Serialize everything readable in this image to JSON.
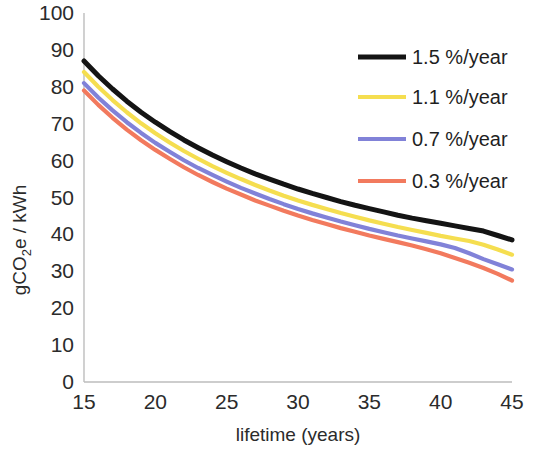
{
  "chart_data": {
    "type": "line",
    "title": "",
    "xlabel": "lifetime (years)",
    "ylabel": "gCO2e / kWh",
    "ylabel_parts": {
      "pre": "gCO",
      "sub": "2",
      "post": "e / kWh"
    },
    "xlim": [
      15,
      45
    ],
    "ylim": [
      0,
      100
    ],
    "xticks": [
      15,
      20,
      25,
      30,
      35,
      40,
      45
    ],
    "yticks": [
      0,
      10,
      20,
      30,
      40,
      50,
      60,
      70,
      80,
      90,
      100
    ],
    "grid": false,
    "legend_position": "top-right",
    "x": [
      15,
      16,
      17,
      18,
      19,
      20,
      21,
      22,
      23,
      24,
      25,
      26,
      27,
      28,
      29,
      30,
      31,
      32,
      33,
      34,
      35,
      36,
      37,
      38,
      39,
      40,
      41,
      42,
      43,
      44,
      45
    ],
    "series": [
      {
        "name": "1.5 %/year",
        "color": "#141414",
        "values": [
          87.0,
          83.0,
          79.4,
          76.1,
          73.1,
          70.4,
          67.9,
          65.6,
          63.5,
          61.5,
          59.7,
          58.0,
          56.4,
          55.0,
          53.6,
          52.3,
          51.1,
          50.0,
          48.9,
          47.9,
          47.0,
          46.1,
          45.2,
          44.4,
          43.7,
          43.0,
          42.3,
          41.6,
          40.9,
          39.7,
          38.5
        ]
      },
      {
        "name": "1.1 %/year",
        "color": "#F5DE50",
        "values": [
          84.0,
          80.0,
          76.4,
          73.1,
          70.1,
          67.4,
          64.9,
          62.6,
          60.5,
          58.5,
          56.7,
          55.0,
          53.4,
          51.9,
          50.5,
          49.2,
          48.0,
          46.9,
          45.8,
          44.8,
          43.8,
          42.9,
          42.0,
          41.2,
          40.4,
          39.6,
          38.9,
          38.2,
          37.2,
          35.9,
          34.5
        ]
      },
      {
        "name": "0.7 %/year",
        "color": "#8182D8",
        "values": [
          81.0,
          77.1,
          73.6,
          70.4,
          67.5,
          64.8,
          62.4,
          60.1,
          58.0,
          56.1,
          54.3,
          52.6,
          51.1,
          49.6,
          48.2,
          46.9,
          45.7,
          44.6,
          43.5,
          42.5,
          41.5,
          40.6,
          39.7,
          38.9,
          38.1,
          37.3,
          36.3,
          34.9,
          33.3,
          31.9,
          30.5
        ]
      },
      {
        "name": "0.3 %/year",
        "color": "#F27A5E",
        "values": [
          79.0,
          75.1,
          71.6,
          68.4,
          65.5,
          62.9,
          60.5,
          58.2,
          56.1,
          54.2,
          52.4,
          50.8,
          49.2,
          47.8,
          46.4,
          45.1,
          43.9,
          42.8,
          41.7,
          40.7,
          39.7,
          38.8,
          37.9,
          37.0,
          36.0,
          34.9,
          33.6,
          32.3,
          30.9,
          29.3,
          27.5
        ]
      }
    ],
    "legend": [
      {
        "label": "1.5 %/year",
        "color": "#141414",
        "width": 5.0
      },
      {
        "label": "1.1 %/year",
        "color": "#F5DE50",
        "width": 4.0
      },
      {
        "label": "0.7 %/year",
        "color": "#8182D8",
        "width": 4.0
      },
      {
        "label": "0.3 %/year",
        "color": "#F27A5E",
        "width": 4.0
      }
    ]
  }
}
